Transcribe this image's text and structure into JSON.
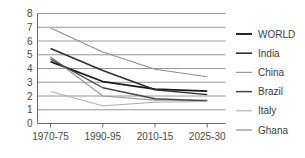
{
  "chart_data": {
    "type": "line",
    "title": "",
    "xlabel": "",
    "ylabel": "",
    "categories": [
      "1970-75",
      "1990-95",
      "2010-15",
      "2025-30"
    ],
    "x": [
      0,
      1,
      2,
      3
    ],
    "ylim": [
      0,
      8
    ],
    "xlim": [
      -0.25,
      3.35
    ],
    "yticks": [
      "0",
      "1",
      "2",
      "3",
      "4",
      "5",
      "6",
      "7",
      "8"
    ],
    "ytick_values": [
      0,
      1,
      2,
      3,
      4,
      5,
      6,
      7,
      8
    ],
    "grid": true,
    "legend_position": "right",
    "series": [
      {
        "name": "WORLD",
        "values": [
          4.5,
          3.05,
          2.5,
          2.35
        ],
        "color": "#1a1a1a",
        "width": 1.7
      },
      {
        "name": "India",
        "values": [
          5.45,
          3.85,
          2.45,
          2.1
        ],
        "color": "#2e2e2e",
        "width": 1.5
      },
      {
        "name": "China",
        "values": [
          4.85,
          2.0,
          1.7,
          1.7
        ],
        "color": "#9a9a9a",
        "width": 1.1
      },
      {
        "name": "Brazil",
        "values": [
          4.7,
          2.6,
          1.8,
          1.65
        ],
        "color": "#454545",
        "width": 1.3
      },
      {
        "name": "Italy",
        "values": [
          2.33,
          1.28,
          1.55,
          1.6
        ],
        "color": "#aeaeae",
        "width": 1.0
      },
      {
        "name": "Ghana",
        "values": [
          6.95,
          5.2,
          3.95,
          3.4
        ],
        "color": "#8f8f8f",
        "width": 1.1
      }
    ]
  },
  "axes": {
    "y_tick_labels": [
      "8",
      "7",
      "6",
      "5",
      "4",
      "3",
      "2",
      "1",
      "0"
    ],
    "x_tick_labels": [
      "1970-75",
      "1990-95",
      "2010-15",
      "2025-30"
    ]
  },
  "legend": {
    "entries": [
      {
        "label": "WORLD",
        "color": "#1a1a1a",
        "width": 1.9
      },
      {
        "label": "India",
        "color": "#2e2e2e",
        "width": 1.6
      },
      {
        "label": "China",
        "color": "#9a9a9a",
        "width": 1.2
      },
      {
        "label": "Brazil",
        "color": "#454545",
        "width": 1.5
      },
      {
        "label": "Italy",
        "color": "#aeaeae",
        "width": 1.1
      },
      {
        "label": "Ghana",
        "color": "#8f8f8f",
        "width": 1.2
      }
    ]
  }
}
